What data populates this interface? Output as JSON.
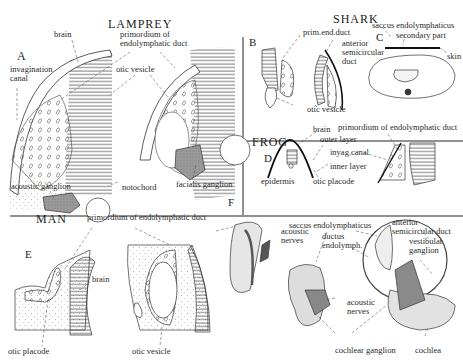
{
  "figure": {
    "panels": {
      "lamprey": {
        "title": "LAMPREY",
        "letter": "A",
        "labels": {
          "brain": "brain",
          "primordium": "primordium of\nendolymphatic duct",
          "invagination": "invagination\ncanal",
          "otic_vesicle": "otic vesicle",
          "acoustic_ganglion": "acoustic ganglion",
          "notochord": "notochord",
          "facialis_ganglion": "facialis ganglion"
        }
      },
      "shark": {
        "title": "SHARK",
        "letter_b": "B",
        "letter_c": "C",
        "labels": {
          "prim_end_duct": "prim.end.duct",
          "anterior_semicircular": "anterior\nsemicircular\nduct",
          "otic_vesicle": "otic vesicle",
          "saccus": "saccus endolymphaticus",
          "secondary_part": "secondary part",
          "skin": "skin"
        }
      },
      "frog": {
        "title": "FROG",
        "letter": "D",
        "labels": {
          "brain": "brain",
          "primordium": "primordium of endolymphatic duct",
          "outer_layer": "outer layer",
          "invag_canal": "inyag.canal",
          "inner_layer": "inner layer",
          "epidermis": "epidermis",
          "otic_placode": "otic placode"
        }
      },
      "man": {
        "title": "MAN",
        "letter_e": "E",
        "letter_f": "F",
        "labels": {
          "primordium": "primordium of endolymphatic duct",
          "brain": "brain",
          "otic_placode": "otic placode",
          "otic_vesicle": "otic vesicle",
          "acoustic_nerves_1": "acoustic\nnerves",
          "saccus": "saccus endolymphaticus",
          "ductus": "ductus\nendolymph.",
          "anterior_semicircular": "anterior\nsemicircular duct",
          "vestibular_ganglion": "vestibular\nganglion",
          "acoustic_nerves_2": "acoustic\nnerves",
          "cochlear_ganglion": "cochlear ganglion",
          "cochlea": "cochlea"
        }
      }
    }
  }
}
